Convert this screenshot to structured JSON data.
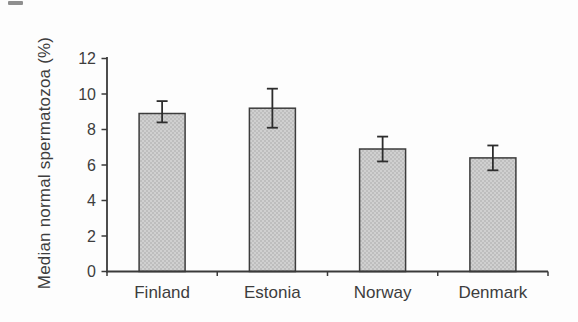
{
  "figure": {
    "background": "#fdfdfd"
  },
  "chart_data": {
    "type": "bar",
    "title": "",
    "xlabel": "",
    "ylabel": "Median normal spermatozoa (%)",
    "categories": [
      "Finland",
      "Estonia",
      "Norway",
      "Denmark"
    ],
    "values": [
      8.9,
      9.2,
      6.9,
      6.4
    ],
    "error_low": [
      8.4,
      8.1,
      6.2,
      5.7
    ],
    "error_high": [
      9.6,
      10.3,
      7.6,
      7.1
    ],
    "ylim": [
      0,
      12
    ],
    "yticks": [
      0,
      2,
      4,
      6,
      8,
      10,
      12
    ],
    "grid": false,
    "legend": "none",
    "colors": {
      "bar_fill": "#d0d0d0",
      "bar_stipple_dot": "#9e9e9e",
      "bar_border": "#3c3c3c",
      "axis": "#3a3a3a",
      "text": "#3d3d3d",
      "error_bar": "#2d2d2d"
    }
  }
}
